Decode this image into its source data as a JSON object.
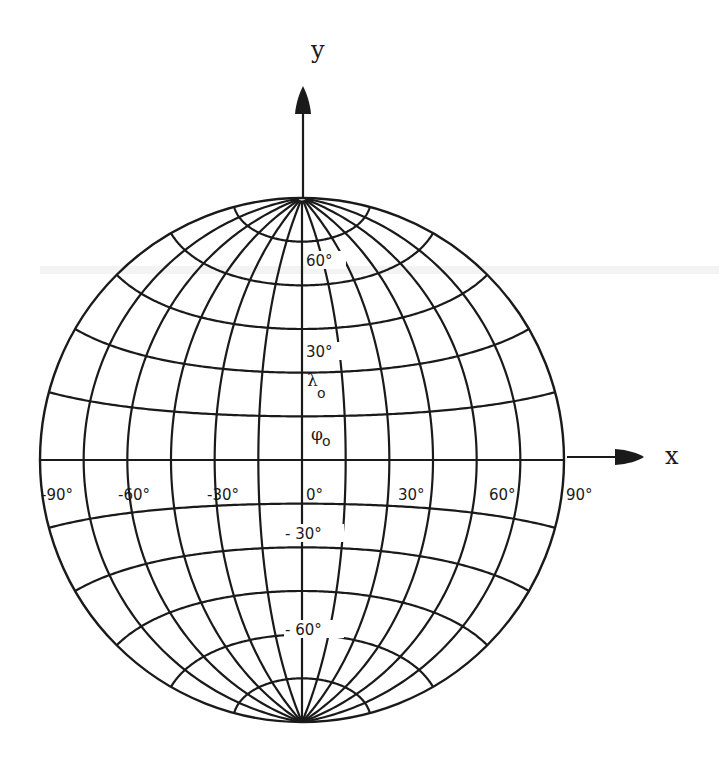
{
  "figure": {
    "type": "map-projection-graticule",
    "projection": "azimuthal-equidistant (equatorial aspect)",
    "graticule_interval_deg": 15,
    "line_color": "#1a1a1a",
    "background": "#ffffff"
  },
  "axes": {
    "x_label": "x",
    "y_label": "y"
  },
  "longitude_labels": [
    {
      "text": "-90°",
      "lon": -90
    },
    {
      "text": "-60°",
      "lon": -60
    },
    {
      "text": "-30°",
      "lon": -30
    },
    {
      "text": "0°",
      "lon": 0
    },
    {
      "text": "30°",
      "lon": 30
    },
    {
      "text": "60°",
      "lon": 60
    },
    {
      "text": "90°",
      "lon": 90
    }
  ],
  "latitude_labels": [
    {
      "text": "60°",
      "lat": 60
    },
    {
      "text": "30°",
      "lat": 30
    },
    {
      "text": "- 30°",
      "lat": -30
    },
    {
      "text": "- 60°",
      "lat": -60
    }
  ],
  "origin_labels": {
    "lambda": {
      "symbol": "λ",
      "subscript": "o"
    },
    "phi": {
      "symbol": "φ",
      "subscript": "o"
    }
  }
}
